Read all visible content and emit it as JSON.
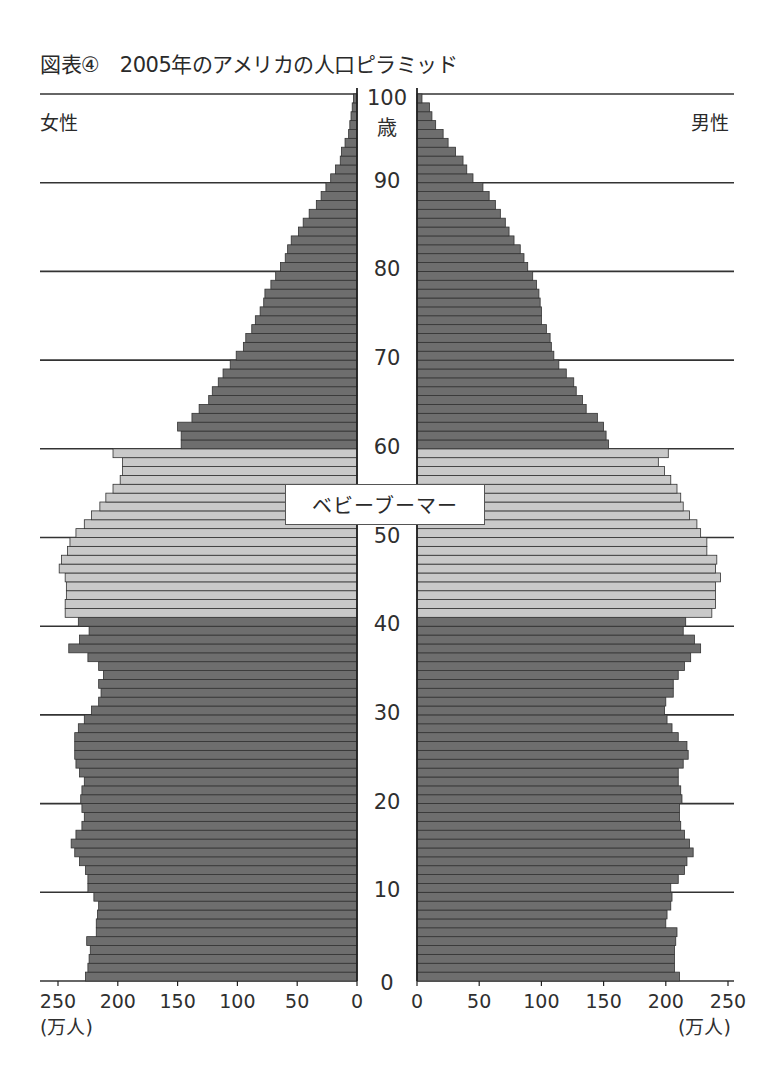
{
  "title": "図表④　2005年のアメリカの人口ピラミッド",
  "labels": {
    "female": "女性",
    "male": "男性",
    "age_unit": "歳",
    "unit": "(万人)",
    "baby_boomer": "ベビーブーマー"
  },
  "colors": {
    "bar_dark": "#6e6e6e",
    "bar_light": "#c9c9c9",
    "bar_edge": "#333333",
    "gridline": "#333333"
  },
  "chart_data": {
    "type": "bar",
    "orientation": "horizontal-pyramid",
    "title": "2005年のアメリカの人口ピラミッド",
    "xlabel": "(万人)",
    "ylabel": "歳",
    "xlim": [
      0,
      250
    ],
    "ylim": [
      0,
      100
    ],
    "x_ticks": [
      0,
      50,
      100,
      150,
      200,
      250
    ],
    "y_ticks": [
      0,
      10,
      20,
      30,
      40,
      50,
      60,
      70,
      80,
      90,
      100
    ],
    "grid": true,
    "highlight": {
      "label": "ベビーブーマー",
      "age_range": [
        41,
        59
      ]
    },
    "categories": [
      0,
      1,
      2,
      3,
      4,
      5,
      6,
      7,
      8,
      9,
      10,
      11,
      12,
      13,
      14,
      15,
      16,
      17,
      18,
      19,
      20,
      21,
      22,
      23,
      24,
      25,
      26,
      27,
      28,
      29,
      30,
      31,
      32,
      33,
      34,
      35,
      36,
      37,
      38,
      39,
      40,
      41,
      42,
      43,
      44,
      45,
      46,
      47,
      48,
      49,
      50,
      51,
      52,
      53,
      54,
      55,
      56,
      57,
      58,
      59,
      60,
      61,
      62,
      63,
      64,
      65,
      66,
      67,
      68,
      69,
      70,
      71,
      72,
      73,
      74,
      75,
      76,
      77,
      78,
      79,
      80,
      81,
      82,
      83,
      84,
      85,
      86,
      87,
      88,
      89,
      90,
      91,
      92,
      93,
      94,
      95,
      96,
      97,
      98,
      99
    ],
    "series": [
      {
        "name": "女性",
        "side": "left",
        "values": [
          227,
          225,
          224,
          223,
          226,
          218,
          218,
          217,
          216,
          220,
          225,
          225,
          227,
          232,
          236,
          239,
          235,
          230,
          228,
          230,
          231,
          230,
          228,
          232,
          235,
          236,
          236,
          236,
          233,
          228,
          222,
          216,
          214,
          216,
          212,
          216,
          225,
          241,
          232,
          224,
          233,
          244,
          244,
          243,
          243,
          244,
          249,
          247,
          242,
          240,
          235,
          228,
          222,
          215,
          210,
          204,
          198,
          196,
          196,
          204,
          147,
          147,
          150,
          138,
          132,
          124,
          121,
          116,
          112,
          106,
          101,
          95,
          93,
          88,
          85,
          81,
          78,
          77,
          72,
          68,
          64,
          60,
          58,
          55,
          49,
          45,
          40,
          34,
          30,
          26,
          22,
          18,
          14,
          13,
          10,
          7,
          6,
          5,
          4,
          3
        ]
      },
      {
        "name": "男性",
        "side": "right",
        "values": [
          211,
          207,
          207,
          207,
          208,
          209,
          200,
          201,
          204,
          205,
          204,
          210,
          215,
          217,
          222,
          219,
          215,
          212,
          211,
          211,
          213,
          212,
          210,
          210,
          214,
          218,
          217,
          210,
          205,
          201,
          199,
          200,
          206,
          206,
          210,
          215,
          220,
          228,
          223,
          214,
          216,
          237,
          240,
          240,
          240,
          244,
          240,
          241,
          233,
          233,
          228,
          225,
          219,
          214,
          212,
          209,
          204,
          199,
          194,
          202,
          154,
          152,
          150,
          145,
          136,
          133,
          128,
          126,
          120,
          114,
          110,
          108,
          107,
          104,
          100,
          100,
          99,
          98,
          96,
          93,
          89,
          86,
          83,
          78,
          74,
          71,
          67,
          63,
          58,
          53,
          45,
          40,
          37,
          31,
          25,
          21,
          15,
          12,
          10,
          4
        ]
      }
    ]
  }
}
